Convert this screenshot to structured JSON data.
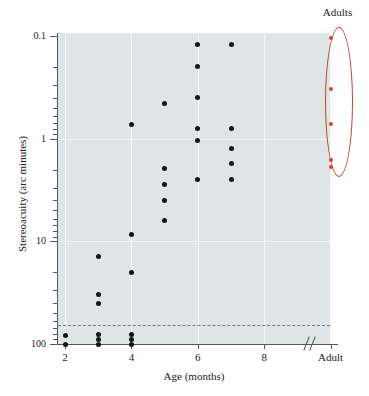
{
  "chart_data": {
    "type": "scatter",
    "title": "",
    "xlabel": "Age (months)",
    "ylabel": "Stereoacuity (arc minutes)",
    "y_scale": "log-inverted",
    "ylim": [
      0.1,
      100
    ],
    "y_ticks": [
      "0.1",
      "1",
      "10",
      "100"
    ],
    "x_ticks": [
      "2",
      "4",
      "6",
      "8",
      "Adult"
    ],
    "x_tick_positions": [
      2,
      4,
      6,
      8,
      10
    ],
    "axis_break": true,
    "grid": true,
    "legend": "none",
    "annotations": [
      {
        "name": "adults-group",
        "label": "Adults",
        "shape": "ellipse",
        "color": "#c8412a"
      }
    ],
    "threshold_line": {
      "label": "",
      "value": 65,
      "style": "dashed"
    },
    "series": [
      {
        "name": "infants",
        "color": "#141414",
        "points": [
          {
            "x": 2,
            "y": 83
          },
          {
            "x": 2,
            "y": 100
          },
          {
            "x": 3,
            "y": 14
          },
          {
            "x": 3,
            "y": 33
          },
          {
            "x": 3,
            "y": 40
          },
          {
            "x": 3,
            "y": 80
          },
          {
            "x": 3,
            "y": 90
          },
          {
            "x": 3,
            "y": 100
          },
          {
            "x": 4,
            "y": 0.73
          },
          {
            "x": 4,
            "y": 8.5
          },
          {
            "x": 4,
            "y": 20
          },
          {
            "x": 4,
            "y": 80
          },
          {
            "x": 4,
            "y": 90
          },
          {
            "x": 4,
            "y": 100
          },
          {
            "x": 5,
            "y": 0.45
          },
          {
            "x": 5,
            "y": 1.95
          },
          {
            "x": 5,
            "y": 2.8
          },
          {
            "x": 5,
            "y": 4.0
          },
          {
            "x": 5,
            "y": 6.3
          },
          {
            "x": 6,
            "y": 0.12
          },
          {
            "x": 6,
            "y": 0.2
          },
          {
            "x": 6,
            "y": 0.4
          },
          {
            "x": 6,
            "y": 0.8
          },
          {
            "x": 6,
            "y": 1.05
          },
          {
            "x": 6,
            "y": 2.5
          },
          {
            "x": 7,
            "y": 0.12
          },
          {
            "x": 7,
            "y": 0.8
          },
          {
            "x": 7,
            "y": 1.25
          },
          {
            "x": 7,
            "y": 1.75
          },
          {
            "x": 7,
            "y": 2.5
          }
        ]
      },
      {
        "name": "adults",
        "color": "#d6422a",
        "points": [
          {
            "x": 10,
            "y": 0.105
          },
          {
            "x": 10,
            "y": 0.33
          },
          {
            "x": 10,
            "y": 0.72
          },
          {
            "x": 10,
            "y": 1.6
          },
          {
            "x": 10,
            "y": 1.9
          }
        ]
      }
    ]
  },
  "colors": {
    "plot_background": "#dde5e7",
    "gridline": "#f4f8f9",
    "axis": "#54585a",
    "point": "#141414",
    "accent": "#c8412a",
    "adult_point": "#d6422a",
    "threshold": "#6d7b80"
  }
}
